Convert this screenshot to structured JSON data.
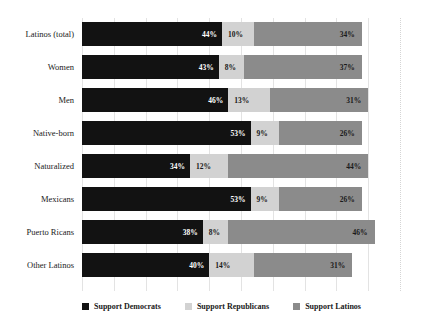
{
  "chart_data": {
    "type": "bar",
    "orientation": "horizontal",
    "stacked": true,
    "title": "",
    "subtitle": "",
    "xlabel": "",
    "ylabel": "",
    "xlim": [
      0,
      100
    ],
    "grid": true,
    "grid_step": 10,
    "legend_position": "bottom",
    "value_suffix": "%",
    "categories": [
      "Latinos (total)",
      "Women",
      "Men",
      "Native-born",
      "Naturalized",
      "Mexicans",
      "Puerto Ricans",
      "Other Latinos"
    ],
    "series": [
      {
        "name": "Support Democrats",
        "color": "#121212",
        "values": [
          44,
          43,
          46,
          53,
          34,
          53,
          38,
          40
        ]
      },
      {
        "name": "Support Republicans",
        "color": "#d2d2d2",
        "values": [
          10,
          8,
          13,
          9,
          12,
          9,
          8,
          14
        ]
      },
      {
        "name": "Support Latinos",
        "color": "#8b8b8b",
        "values": [
          34,
          37,
          31,
          26,
          44,
          26,
          46,
          31
        ]
      }
    ],
    "data_labels": [
      {
        "category": "Latinos (total)",
        "Support Democrats": "44%",
        "Support Republicans": "10%",
        "Support Latinos": "34%"
      },
      {
        "category": "Women",
        "Support Democrats": "43%",
        "Support Republicans": "8%",
        "Support Latinos": "37%"
      },
      {
        "category": "Men",
        "Support Democrats": "46%",
        "Support Republicans": "13%",
        "Support Latinos": "31%"
      },
      {
        "category": "Native-born",
        "Support Democrats": "53%",
        "Support Republicans": "9%",
        "Support Latinos": "26%"
      },
      {
        "category": "Naturalized",
        "Support Democrats": "34%",
        "Support Republicans": "12%",
        "Support Latinos": "44%"
      },
      {
        "category": "Mexicans",
        "Support Democrats": "53%",
        "Support Republicans": "9%",
        "Support Latinos": "26%"
      },
      {
        "category": "Puerto Ricans",
        "Support Democrats": "38%",
        "Support Republicans": "8%",
        "Support Latinos": "46%"
      },
      {
        "category": "Other Latinos",
        "Support Democrats": "40%",
        "Support Republicans": "14%",
        "Support Latinos": "31%"
      }
    ]
  },
  "legend": {
    "items": [
      {
        "label": "Support Democrats",
        "color": "#121212"
      },
      {
        "label": "Support Republicans",
        "color": "#d2d2d2"
      },
      {
        "label": "Support Latinos",
        "color": "#8b8b8b"
      }
    ]
  }
}
